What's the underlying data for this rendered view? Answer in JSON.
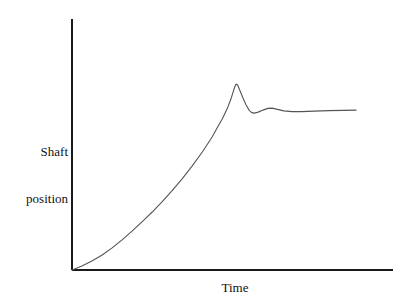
{
  "figure": {
    "background_color": "#ffffff",
    "width": 411,
    "height": 304
  },
  "axes": {
    "line_color": "#1a1a1a",
    "origin": {
      "x": 72,
      "y": 270
    },
    "y_axis_top": {
      "x": 72,
      "y": 19
    },
    "x_axis_right": {
      "x": 393,
      "y": 270
    }
  },
  "labels": {
    "y_axis_line1": "Shaft",
    "y_axis_line2": "position",
    "y_axis_full": "Shaft position",
    "x_axis": "Time"
  },
  "chart_data": {
    "type": "line",
    "title": "",
    "xlabel": "Time",
    "ylabel": "Shaft position",
    "grid": false,
    "legend": false,
    "axis_ticks": false,
    "axis_tick_labels": false,
    "xlim": [
      0,
      1
    ],
    "ylim": [
      0,
      1
    ],
    "series": [
      {
        "name": "Shaft position response",
        "color": "#555555",
        "description": "Exponential rise to an overshoot peak, sharp drop, small secondary bump, then a nearly flat slowly rising settle",
        "annotations": [
          {
            "name": "start",
            "x": 0.0,
            "y": 0.0
          },
          {
            "name": "overshoot-peak",
            "x": 0.511,
            "y": 0.741
          },
          {
            "name": "undershoot-trough",
            "x": 0.564,
            "y": 0.625
          },
          {
            "name": "secondary-bump",
            "x": 0.623,
            "y": 0.645
          },
          {
            "name": "settle-end",
            "x": 0.885,
            "y": 0.637
          }
        ],
        "points": [
          [
            0.0,
            0.0
          ],
          [
            0.031,
            0.016
          ],
          [
            0.062,
            0.036
          ],
          [
            0.094,
            0.06
          ],
          [
            0.125,
            0.088
          ],
          [
            0.156,
            0.12
          ],
          [
            0.187,
            0.155
          ],
          [
            0.218,
            0.192
          ],
          [
            0.25,
            0.231
          ],
          [
            0.281,
            0.272
          ],
          [
            0.312,
            0.316
          ],
          [
            0.343,
            0.363
          ],
          [
            0.374,
            0.414
          ],
          [
            0.406,
            0.47
          ],
          [
            0.437,
            0.531
          ],
          [
            0.452,
            0.566
          ],
          [
            0.468,
            0.602
          ],
          [
            0.483,
            0.641
          ],
          [
            0.495,
            0.681
          ],
          [
            0.503,
            0.714
          ],
          [
            0.508,
            0.733
          ],
          [
            0.511,
            0.741
          ],
          [
            0.516,
            0.737
          ],
          [
            0.523,
            0.715
          ],
          [
            0.532,
            0.687
          ],
          [
            0.542,
            0.658
          ],
          [
            0.552,
            0.636
          ],
          [
            0.56,
            0.627
          ],
          [
            0.568,
            0.625
          ],
          [
            0.58,
            0.629
          ],
          [
            0.595,
            0.637
          ],
          [
            0.61,
            0.644
          ],
          [
            0.623,
            0.645
          ],
          [
            0.64,
            0.64
          ],
          [
            0.66,
            0.634
          ],
          [
            0.685,
            0.631
          ],
          [
            0.715,
            0.631
          ],
          [
            0.755,
            0.633
          ],
          [
            0.8,
            0.635
          ],
          [
            0.845,
            0.636
          ],
          [
            0.885,
            0.637
          ]
        ]
      }
    ]
  }
}
